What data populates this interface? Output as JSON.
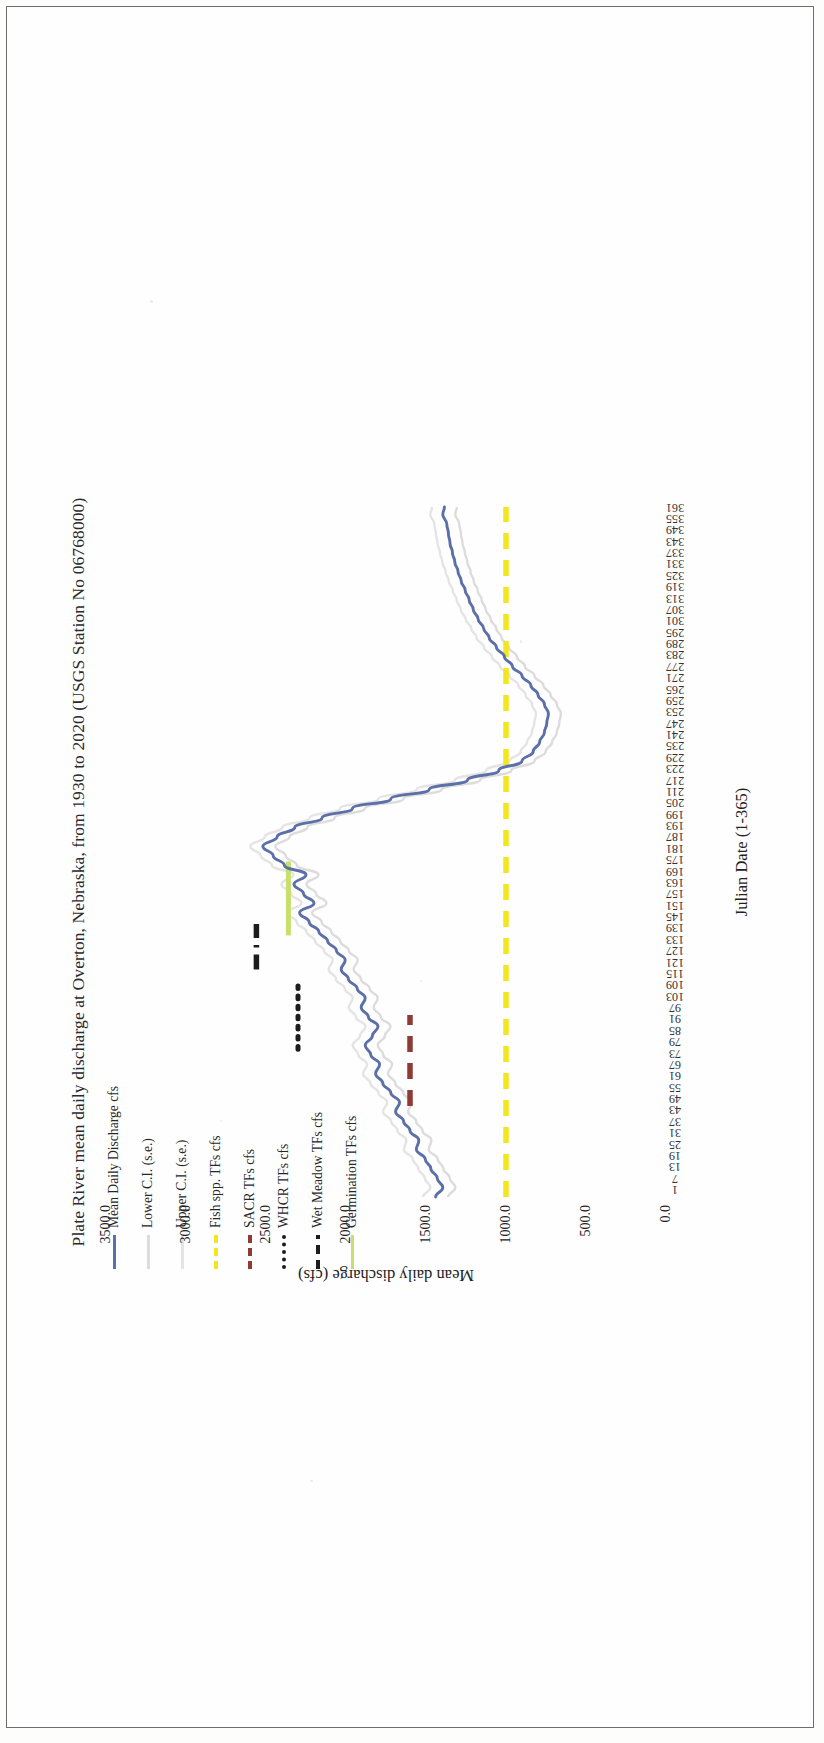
{
  "figure": {
    "title": "Plate River mean daily discharge at Overton, Nebraska, from 1930 to 2020 (USGS Station No 06768000)"
  },
  "legend": {
    "items": [
      {
        "label": "Mean Daily Discharge cfs",
        "style": "solid",
        "color": "#5b6fa8"
      },
      {
        "label": "Lower C.I. (s.e.)",
        "style": "solid",
        "color": "#dcdcdc"
      },
      {
        "label": "Upper C.I. (s.e.)",
        "style": "solid",
        "color": "#e4e4e4"
      },
      {
        "label": "Fish spp. TFs cfs",
        "style": "dash",
        "color": "#f2e61c"
      },
      {
        "label": "SACR TFs cfs",
        "style": "dash",
        "color": "#8e3b36"
      },
      {
        "label": "WHCR TFs cfs",
        "style": "dot",
        "color": "#1c1c1c"
      },
      {
        "label": "Wet Meadow TFs cfs",
        "style": "dashdot",
        "color": "#1c1c1c"
      },
      {
        "label": "Germination TFs cfs",
        "style": "solid",
        "color": "#c8e06a"
      }
    ]
  },
  "chart_data": {
    "type": "line",
    "title": "Plate River mean daily discharge at Overton, Nebraska, from 1930 to 2020 (USGS Station No 06768000)",
    "xlabel": "Julian Date (1-365)",
    "ylabel": "Mean daily discharge (cfs)",
    "xlim": [
      1,
      365
    ],
    "ylim": [
      0,
      3500
    ],
    "grid": false,
    "legend_position": "top-left",
    "yticks": [
      "0.0",
      "500.0",
      "1000.0",
      "1500.0",
      "2000.0",
      "2500.0",
      "3000.0",
      "3500.0"
    ],
    "ytick_values": [
      0,
      500,
      1000,
      1500,
      2000,
      2500,
      3000,
      3500
    ],
    "xticks": [
      1,
      7,
      13,
      19,
      25,
      31,
      37,
      43,
      49,
      55,
      61,
      67,
      73,
      79,
      85,
      91,
      97,
      103,
      109,
      115,
      121,
      127,
      133,
      139,
      145,
      151,
      157,
      163,
      169,
      175,
      181,
      187,
      193,
      199,
      205,
      211,
      217,
      223,
      229,
      235,
      241,
      247,
      253,
      259,
      265,
      271,
      277,
      283,
      289,
      295,
      301,
      307,
      313,
      319,
      325,
      331,
      337,
      343,
      349,
      355,
      361
    ],
    "series": [
      {
        "name": "Mean Daily Discharge cfs",
        "color": "#5b6fa8",
        "style": "solid",
        "x": [
          1,
          6,
          11,
          16,
          21,
          26,
          31,
          36,
          41,
          46,
          51,
          56,
          61,
          66,
          71,
          76,
          81,
          86,
          91,
          96,
          101,
          106,
          111,
          116,
          121,
          126,
          131,
          136,
          141,
          146,
          151,
          156,
          161,
          166,
          171,
          176,
          181,
          186,
          191,
          196,
          201,
          206,
          211,
          216,
          221,
          226,
          231,
          236,
          241,
          246,
          251,
          256,
          261,
          266,
          271,
          276,
          281,
          286,
          291,
          296,
          301,
          306,
          311,
          316,
          321,
          326,
          331,
          336,
          341,
          346,
          351,
          356,
          361,
          365
        ],
        "y": [
          1440,
          1395,
          1430,
          1470,
          1505,
          1560,
          1545,
          1600,
          1640,
          1690,
          1665,
          1720,
          1770,
          1815,
          1790,
          1845,
          1880,
          1835,
          1800,
          1860,
          1905,
          1880,
          1930,
          1985,
          2030,
          2005,
          2060,
          2115,
          2170,
          2230,
          2290,
          2200,
          2265,
          2325,
          2250,
          2385,
          2455,
          2520,
          2430,
          2320,
          2150,
          1960,
          1720,
          1480,
          1240,
          1045,
          900,
          830,
          790,
          760,
          745,
          735,
          760,
          800,
          845,
          900,
          960,
          1010,
          1060,
          1105,
          1140,
          1175,
          1205,
          1230,
          1255,
          1280,
          1300,
          1320,
          1335,
          1350,
          1360,
          1370,
          1395,
          1385
        ]
      },
      {
        "name": "Lower C.I. (s.e.)",
        "color": "#dcdcdc",
        "style": "solid",
        "note": "faint lower standard-error envelope, closely tracks the mean"
      },
      {
        "name": "Upper C.I. (s.e.)",
        "color": "#e4e4e4",
        "style": "solid",
        "note": "faint upper standard-error envelope, closely tracks the mean"
      }
    ],
    "reference_lines": [
      {
        "name": "Fish spp. TFs cfs",
        "orientation": "horizontal",
        "value": 1000,
        "color": "#f2e61c",
        "style": "dash",
        "span_x": [
          1,
          365
        ]
      },
      {
        "name": "SACR TFs cfs",
        "orientation": "horizontal",
        "value": 1600,
        "color": "#8e3b36",
        "style": "dash",
        "span_x": [
          49,
          97
        ]
      },
      {
        "name": "WHCR TFs cfs",
        "orientation": "horizontal",
        "value": 2300,
        "color": "#1c1c1c",
        "style": "dot",
        "span_x": [
          79,
          115
        ]
      },
      {
        "name": "Wet Meadow TFs cfs",
        "orientation": "horizontal",
        "value": 2560,
        "color": "#1c1c1c",
        "style": "dashdot",
        "span_x": [
          121,
          145
        ]
      },
      {
        "name": "Germination TFs cfs",
        "orientation": "vertical",
        "value": 0,
        "color": "#c8e06a",
        "style": "solid",
        "span_x": [
          139,
          178
        ],
        "note": "green band spanning germination window, drawn at constant discharge near 2360 cfs"
      }
    ]
  }
}
